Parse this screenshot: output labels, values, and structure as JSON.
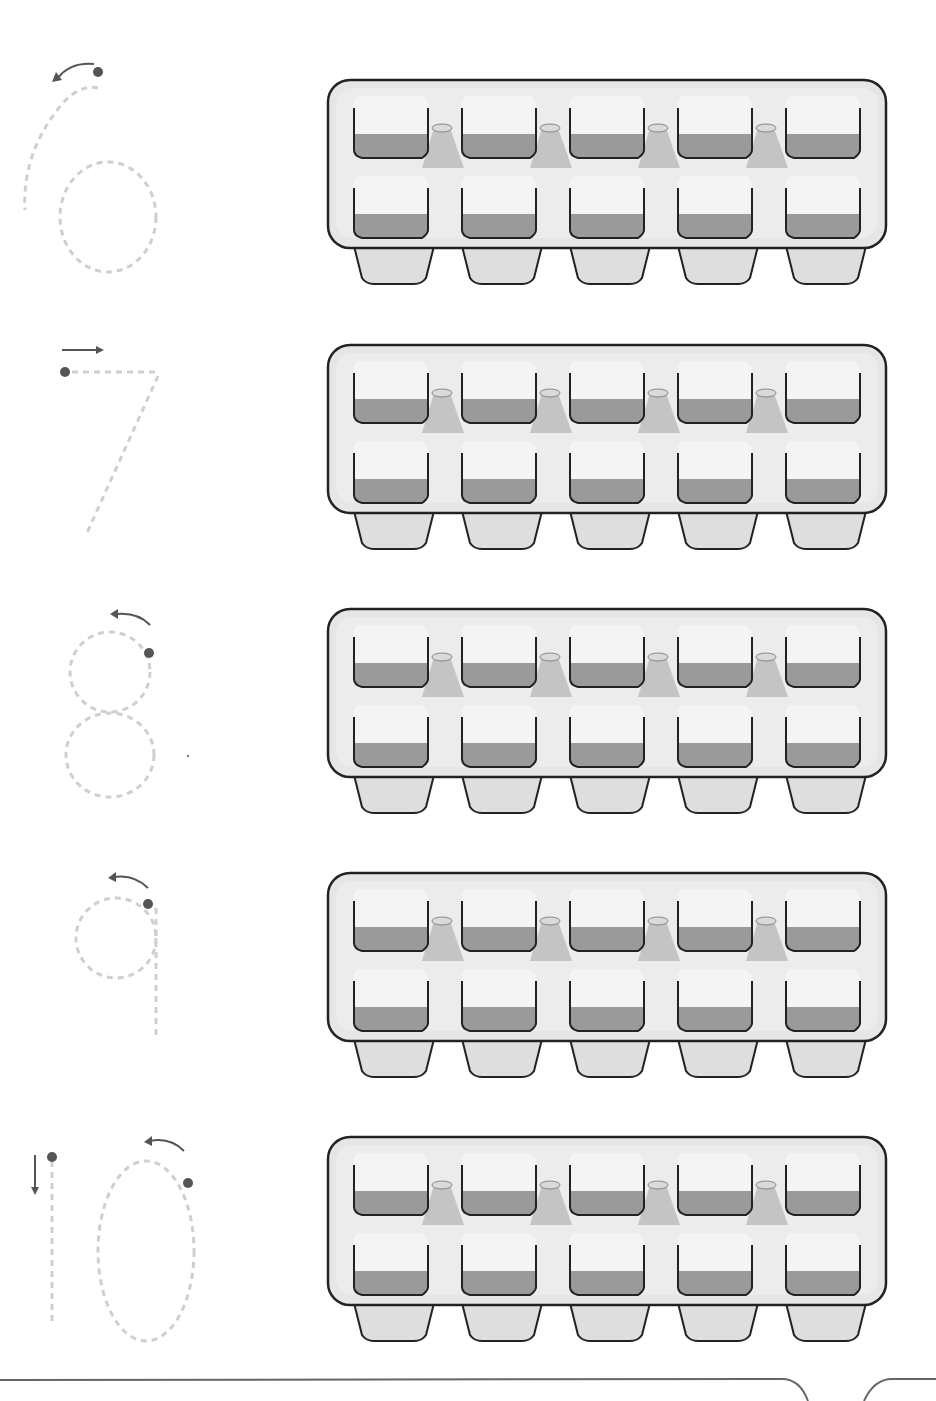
{
  "worksheet": {
    "rows": [
      {
        "numeral": "6",
        "label": "Trace number 6",
        "tray_cells": 10,
        "tray_top": 78
      },
      {
        "numeral": "7",
        "label": "Trace number 7",
        "tray_cells": 10,
        "tray_top": 343
      },
      {
        "numeral": "8",
        "label": "Trace number 8",
        "tray_cells": 10,
        "tray_top": 607
      },
      {
        "numeral": "9",
        "label": "Trace number 9",
        "tray_cells": 10,
        "tray_top": 871
      },
      {
        "numeral": "10",
        "label": "Trace number 10",
        "tray_cells": 10,
        "tray_top": 1135
      }
    ],
    "tray": {
      "columns": 5,
      "rows": 2
    },
    "colors": {
      "dash": "#cfcfcf",
      "guide": "#555555",
      "tray_fill": "#e6e6e6",
      "tray_outline": "#222222",
      "cell_top": "#f2f2f2",
      "cell_bottom": "#9a9a9a",
      "pillar": "#bdbdbd",
      "foot": "#dedede"
    }
  }
}
